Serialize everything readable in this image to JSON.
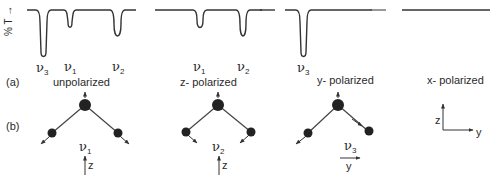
{
  "figure": {
    "y_axis_label": "% T →",
    "row_labels": {
      "a": "(a)",
      "b": "(b)"
    },
    "panels": [
      {
        "polarization": "unpolarized",
        "bands": [
          {
            "name": "ν3",
            "symbol": "ν",
            "sub": "3",
            "x": 43,
            "depth": "strong"
          },
          {
            "name": "ν1",
            "symbol": "ν",
            "sub": "1",
            "x": 70,
            "depth": "weak"
          },
          {
            "name": "ν2",
            "symbol": "ν",
            "sub": "2",
            "x": 118,
            "depth": "medium"
          }
        ]
      },
      {
        "polarization": "z- polarized",
        "bands": [
          {
            "name": "ν1",
            "symbol": "ν",
            "sub": "1",
            "x": 200,
            "depth": "weak"
          },
          {
            "name": "ν2",
            "symbol": "ν",
            "sub": "2",
            "x": 243,
            "depth": "medium"
          }
        ]
      },
      {
        "polarization": "y- polarized",
        "bands": [
          {
            "name": "ν3",
            "symbol": "ν",
            "sub": "3",
            "x": 303,
            "depth": "strong"
          }
        ]
      },
      {
        "polarization": "x- polarized",
        "bands": []
      }
    ],
    "modes": [
      {
        "name": "ν1",
        "symbol": "ν",
        "sub": "1",
        "symmetry_axis": "z"
      },
      {
        "name": "ν2",
        "symbol": "ν",
        "sub": "2",
        "symmetry_axis": "z"
      },
      {
        "name": "ν3",
        "symbol": "ν",
        "sub": "3",
        "symmetry_axis": "y"
      }
    ],
    "axes_legend": {
      "vertical": "z",
      "horizontal": "y"
    }
  }
}
